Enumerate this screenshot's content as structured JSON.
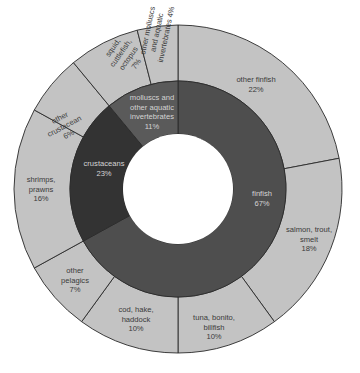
{
  "chart_data": {
    "type": "pie",
    "subtype": "sunburst-donut",
    "title": "",
    "center": [
      178,
      189
    ],
    "radii": {
      "hole": 55,
      "inner_outer": 108,
      "outer_outer": 164
    },
    "start_angle_deg": 0,
    "direction": "clockwise",
    "colors": {
      "finfish": "#4e4e4e",
      "crustaceans": "#333333",
      "molluscs": "#5a5a5a",
      "outer": "#c3c3c3",
      "stroke": "#2a2a2a",
      "hole": "#ffffff"
    },
    "inner_ring": [
      {
        "label": "finfish",
        "value": 67,
        "display": "67%",
        "color_key": "finfish"
      },
      {
        "label": "crustaceans",
        "value": 22,
        "display": "23%",
        "color_key": "crustaceans"
      },
      {
        "label": "molluscs and other aquatic invertebrates",
        "value": 11,
        "display": "11%",
        "color_key": "molluscs"
      }
    ],
    "outer_ring": [
      {
        "label": "other finfish",
        "value": 22,
        "display": "22%",
        "parent": "finfish"
      },
      {
        "label": "salmon, trout, smelt",
        "value": 18,
        "display": "18%",
        "parent": "finfish"
      },
      {
        "label": "tuna, bonito, billfish",
        "value": 10,
        "display": "10%",
        "parent": "finfish"
      },
      {
        "label": "cod, hake, haddock",
        "value": 10,
        "display": "10%",
        "parent": "finfish"
      },
      {
        "label": "other pelagics",
        "value": 7,
        "display": "7%",
        "parent": "finfish"
      },
      {
        "label": "shrimps, prawns",
        "value": 16,
        "display": "16%",
        "parent": "crustaceans"
      },
      {
        "label": "other crustacean",
        "value": 6,
        "display": "6%",
        "parent": "crustaceans"
      },
      {
        "label": "squid, cuttlefish, octopus",
        "value": 7,
        "display": "7%",
        "parent": "molluscs and other aquatic invertebrates"
      },
      {
        "label": "other molluscs and aquatic invertebrates",
        "value": 4,
        "display": "4%",
        "parent": "molluscs and other aquatic invertebrates"
      }
    ],
    "legend": "none (labels inside segments)",
    "grid": false
  },
  "labels": {
    "inner": [
      {
        "lines": [
          "finfish",
          "67%"
        ],
        "x": 262,
        "y": 196,
        "rot": 0
      },
      {
        "lines": [
          "crustaceans",
          "23%"
        ],
        "x": 104,
        "y": 166,
        "rot": 0
      },
      {
        "lines": [
          "molluscs and",
          "other aquatic",
          "invertebrates",
          "11%"
        ],
        "x": 152,
        "y": 100,
        "rot": 0
      }
    ],
    "outer": [
      {
        "lines": [
          "other finfish",
          "22%"
        ],
        "x": 256,
        "y": 82,
        "rot": 0
      },
      {
        "lines": [
          "salmon, trout,",
          "smelt",
          "18%"
        ],
        "x": 309,
        "y": 232,
        "rot": 0
      },
      {
        "lines": [
          "tuna, bonito,",
          "billfish",
          "10%"
        ],
        "x": 214,
        "y": 320,
        "rot": 0
      },
      {
        "lines": [
          "cod, hake,",
          "haddock",
          "10%"
        ],
        "x": 136,
        "y": 312,
        "rot": 0
      },
      {
        "lines": [
          "other",
          "pelagics",
          "7%"
        ],
        "x": 75,
        "y": 273,
        "rot": 0
      },
      {
        "lines": [
          "shrimps,",
          "prawns",
          "16%"
        ],
        "x": 41,
        "y": 182,
        "rot": 0
      },
      {
        "lines": [
          "other",
          "crustacean",
          "6%"
        ],
        "x": 61,
        "y": 120,
        "rot": -28
      },
      {
        "lines": [
          "squid,",
          "cuttlefish,",
          "octopus",
          "7%"
        ],
        "x": 115,
        "y": 49,
        "rot": -55
      },
      {
        "lines": [
          "other molluscs",
          "and aquatic",
          "invertebrates 4%"
        ],
        "x": 150,
        "y": 31,
        "rot": -78
      }
    ]
  }
}
